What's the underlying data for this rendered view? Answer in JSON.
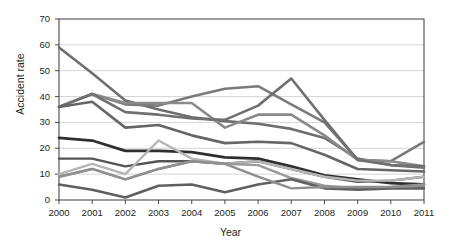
{
  "chart_data": {
    "type": "line",
    "title": "",
    "xlabel": "Year",
    "ylabel": "Accident rate",
    "categories": [
      "2000",
      "2001",
      "2002",
      "2003",
      "2004",
      "2005",
      "2006",
      "2007",
      "2008",
      "2009",
      "2010",
      "2011"
    ],
    "x": [
      2000,
      2001,
      2002,
      2003,
      2004,
      2005,
      2006,
      2007,
      2008,
      2009,
      2010,
      2011
    ],
    "xlim": [
      2000,
      2011
    ],
    "ylim": [
      0,
      70
    ],
    "yticks": [
      0,
      10,
      20,
      30,
      40,
      50,
      60,
      70
    ],
    "xticks": [
      "2000",
      "2001",
      "2002",
      "2003",
      "2004",
      "2005",
      "2006",
      "2007",
      "2008",
      "2009",
      "2010",
      "2011"
    ],
    "grid": "horizontal",
    "legend": "none",
    "markers": "none",
    "series": [
      {
        "name": "series-1",
        "color": "#6e6e6e",
        "width": 2.6,
        "values": [
          59,
          49,
          38.5,
          35,
          32,
          30.5,
          29.5,
          27.5,
          24,
          16,
          13.5,
          12.5
        ]
      },
      {
        "name": "series-2",
        "color": "#7a7a7a",
        "width": 2.6,
        "values": [
          36,
          41,
          37,
          36.5,
          40,
          43,
          44,
          37,
          30,
          15.5,
          15,
          22.5
        ]
      },
      {
        "name": "series-3",
        "color": "#8a8a8a",
        "width": 2.6,
        "values": [
          36,
          41,
          37.5,
          37.5,
          37.5,
          28,
          33,
          33,
          25,
          15.5,
          15,
          13
        ]
      },
      {
        "name": "series-4",
        "color": "#707070",
        "width": 2.6,
        "values": [
          36,
          41,
          34,
          33,
          31.5,
          31,
          36.5,
          47,
          31,
          15.5,
          13.5,
          13
        ]
      },
      {
        "name": "series-5",
        "color": "#666666",
        "width": 2.6,
        "values": [
          36,
          38,
          28,
          29,
          25,
          22,
          22.5,
          22,
          17.5,
          12,
          11.5,
          11
        ]
      },
      {
        "name": "series-6",
        "color": "#2f2f2f",
        "width": 2.8,
        "values": [
          24,
          23,
          19,
          19,
          18.5,
          16.5,
          16,
          13,
          9.5,
          8,
          6.5,
          6
        ]
      },
      {
        "name": "series-7",
        "color": "#555555",
        "width": 2.4,
        "values": [
          16,
          16,
          13,
          15,
          15,
          14,
          15,
          12,
          9,
          7,
          7.5,
          9
        ]
      },
      {
        "name": "series-8",
        "color": "#b5b5b5",
        "width": 2.4,
        "values": [
          10,
          14,
          10,
          23,
          16,
          14,
          15,
          12,
          9,
          7.5,
          7.5,
          9
        ]
      },
      {
        "name": "series-9",
        "color": "#9a9a9a",
        "width": 2.4,
        "values": [
          9,
          12,
          8,
          12,
          15,
          14,
          13.5,
          8.5,
          5.5,
          4.5,
          5,
          6
        ]
      },
      {
        "name": "series-10",
        "color": "#606060",
        "width": 2.6,
        "values": [
          6,
          4,
          1,
          5.5,
          6,
          3,
          6,
          8,
          4.5,
          4,
          4.5,
          4.5
        ]
      },
      {
        "name": "series-11",
        "color": "#8f8f8f",
        "width": 2.4,
        "values": [
          9,
          12,
          8,
          12,
          15,
          14,
          9,
          4.5,
          5,
          5,
          5,
          5.5
        ]
      }
    ]
  }
}
